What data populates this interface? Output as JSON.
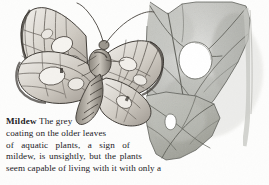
{
  "page": {
    "background_color": "#fdfdfc",
    "text_color": "#22201e"
  },
  "illustration": {
    "name": "moth-and-damaged-lily-leaf-drawing",
    "medium": "pencil-drawing-grayscale",
    "subjects": [
      {
        "name": "moth",
        "description": "brown-and-cream patterned moth with spread wings, banded abdomen and curved antennae",
        "position": "left"
      },
      {
        "name": "water-lily-leaf",
        "description": "grey-green aquatic leaf with prominent veins and two chewed holes",
        "position": "right"
      }
    ],
    "palette": {
      "leaf_light": "#d6d6d2",
      "leaf_mid": "#b4b5b0",
      "leaf_dark": "#8e8f8a",
      "vein": "#5e5f59",
      "moth_light": "#e8e5df",
      "moth_mid": "#9a958c",
      "moth_dark": "#4a4641",
      "hole": "#ffffff"
    }
  },
  "caption": {
    "term": "Mildew",
    "lines": [
      "The grey",
      "coating on the older leaves",
      "of aquatic plants, a sign of",
      "mildew, is unsightly, but the plants",
      "seem capable of living with it with only a"
    ],
    "full_text": "Mildew The grey coating on the older leaves of aquatic plants, a sign of mildew, is unsightly, but the plants seem capable of living with it with only a"
  }
}
